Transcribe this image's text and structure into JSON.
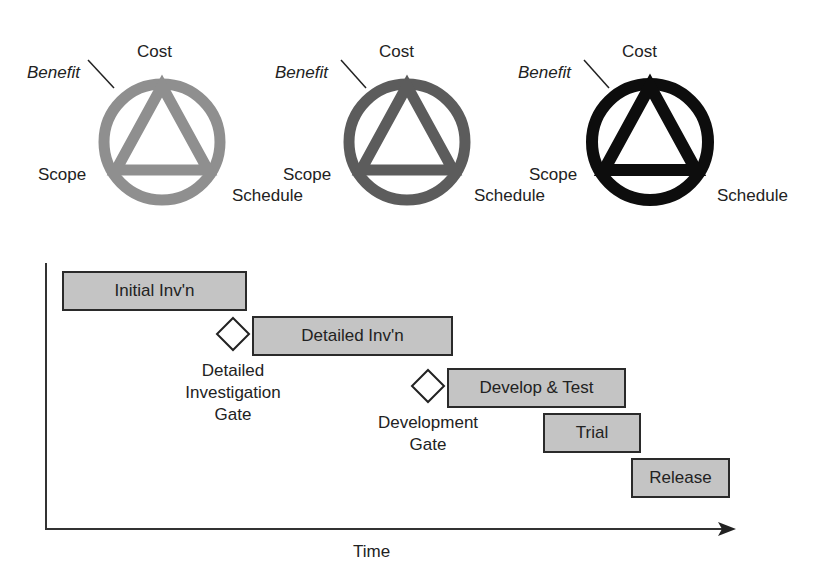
{
  "triangles": [
    {
      "cost": "Cost",
      "benefit": "Benefit",
      "scope": "Scope",
      "schedule": "Schedule",
      "color": "#8f8f8f"
    },
    {
      "cost": "Cost",
      "benefit": "Benefit",
      "scope": "Scope",
      "schedule": "Schedule",
      "color": "#5c5c5c"
    },
    {
      "cost": "Cost",
      "benefit": "Benefit",
      "scope": "Scope",
      "schedule": "Schedule",
      "color": "#0d0d0d"
    }
  ],
  "timeline": {
    "axis_label": "Time",
    "phases": [
      {
        "label": "Initial Inv'n"
      },
      {
        "label": "Detailed Inv'n"
      },
      {
        "label": "Develop & Test"
      },
      {
        "label": "Trial"
      },
      {
        "label": "Release"
      }
    ],
    "gates": [
      {
        "line1": "Detailed",
        "line2": "Investigation",
        "line3": "Gate"
      },
      {
        "line1": "Development",
        "line2": "Gate"
      }
    ],
    "bar_fill": "#c4c4c4"
  }
}
